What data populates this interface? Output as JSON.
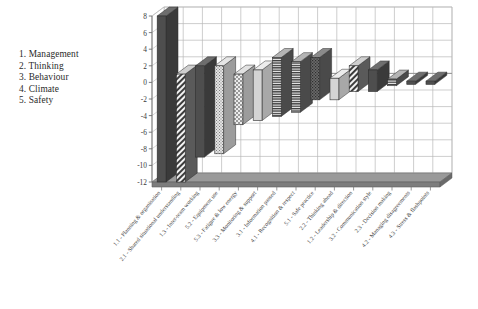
{
  "legend": {
    "items": [
      {
        "label": "1. Management"
      },
      {
        "label": "2. Thinking"
      },
      {
        "label": "3. Behaviour"
      },
      {
        "label": "4. Climate"
      },
      {
        "label": "5. Safety"
      }
    ]
  },
  "chart_data": {
    "type": "bar",
    "title": "",
    "subtitle": "",
    "xlabel": "",
    "ylabel": "",
    "ylim": [
      -12,
      8
    ],
    "yticks": [
      8,
      6,
      4,
      2,
      0,
      -2,
      -4,
      -6,
      -8,
      -10,
      -12
    ],
    "ytick_labels": [
      "8",
      "6",
      "4",
      "2",
      "0",
      "-2",
      "-4",
      "-6",
      "-8",
      "-10",
      "-12"
    ],
    "grid": true,
    "legend_position": "left-outside",
    "style": "3d-floating-column",
    "categories": [
      "1.1 - Planning & organisation",
      "2.1 - Shared situational understanding",
      "1.3 - Inter-team working",
      "5.2 - Equipment use",
      "5.3 - Fatigue & low energy",
      "3.3 - Monitoring & support",
      "3.1 - Information passed",
      "4.1 - Recognition & respect",
      "5.1 - Safe practice",
      "2.2 - Thinking ahead",
      "1.2 - Leadership & direction",
      "3.2 - Communication style",
      "2.3 - Decision making",
      "4.2 - Managing disagreements",
      "4.3 - Stress & flashpoints"
    ],
    "tops": [
      8.0,
      1.0,
      2.0,
      2.0,
      1.0,
      1.5,
      3.0,
      2.5,
      3.0,
      0.5,
      2.0,
      1.5,
      0.4,
      0.15,
      0.15
    ],
    "bottoms": [
      -12.0,
      -12.0,
      -9.0,
      -8.6,
      -5.1,
      -4.6,
      -4.1,
      -3.6,
      -2.1,
      -2.1,
      -1.1,
      -1.1,
      -0.4,
      -0.1,
      -0.1
    ],
    "patterns": [
      "solid-dark",
      "diagonal-stripe",
      "solid-dark",
      "dot-light",
      "checker-light",
      "solid-light",
      "hline-dark",
      "hline-dark",
      "dot-dark",
      "solid-light",
      "diagonal-stripe",
      "solid-dark",
      "hline-dark",
      "solid-dark",
      "solid-dark"
    ]
  },
  "colors": {
    "bar_dark": "#4a4a4a",
    "bar_light": "#d0d0d0",
    "grid": "#b9b9b9",
    "axis": "#6e6e6e",
    "floor": "#8a8a8a",
    "text": "#3a3a3a"
  }
}
